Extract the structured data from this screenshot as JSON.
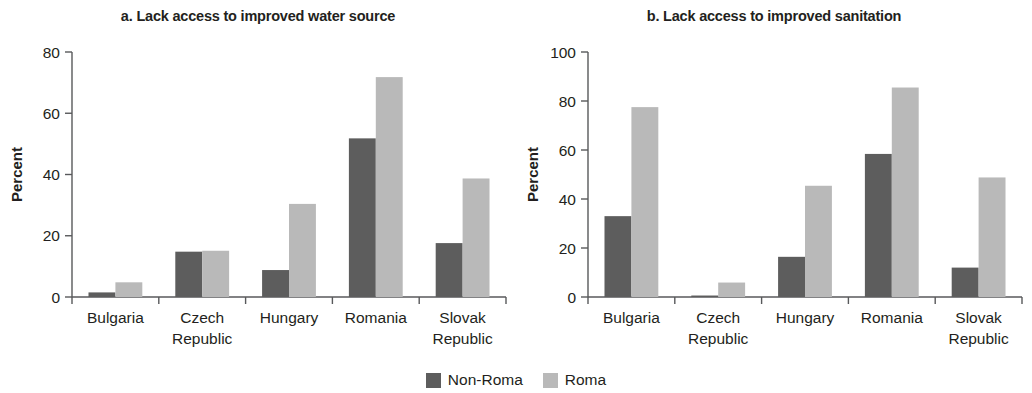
{
  "figure": {
    "legend": [
      {
        "name": "Non-Roma",
        "color": "#5d5d5d"
      },
      {
        "name": "Roma",
        "color": "#b9b9b9"
      }
    ]
  },
  "chart_data": [
    {
      "type": "bar",
      "panel_id": "a",
      "title": "a. Lack access to improved water source",
      "xlabel": "",
      "ylabel": "Percent",
      "ylim": [
        0,
        80
      ],
      "yticks": [
        0,
        20,
        40,
        60,
        80
      ],
      "grid": false,
      "legend_position": "bottom-center",
      "categories": [
        "Bulgaria",
        "Czech Republic",
        "Hungary",
        "Romania",
        "Slovak Republic"
      ],
      "series": [
        {
          "name": "Non-Roma",
          "color": "#5d5d5d",
          "values": [
            1.5,
            14.8,
            8.8,
            51.8,
            17.6
          ]
        },
        {
          "name": "Roma",
          "color": "#b9b9b9",
          "values": [
            4.8,
            15.1,
            30.4,
            71.8,
            38.7
          ]
        }
      ]
    },
    {
      "type": "bar",
      "panel_id": "b",
      "title": "b. Lack access to improved sanitation",
      "xlabel": "",
      "ylabel": "Percent",
      "ylim": [
        0,
        100
      ],
      "yticks": [
        0,
        20,
        40,
        60,
        80,
        100
      ],
      "grid": false,
      "legend_position": "bottom-center",
      "categories": [
        "Bulgaria",
        "Czech Republic",
        "Hungary",
        "Romania",
        "Slovak Republic"
      ],
      "series": [
        {
          "name": "Non-Roma",
          "color": "#5d5d5d",
          "values": [
            33.0,
            0.6,
            16.4,
            58.4,
            12.0
          ]
        },
        {
          "name": "Roma",
          "color": "#b9b9b9",
          "values": [
            77.5,
            5.9,
            45.4,
            85.5,
            48.8
          ]
        }
      ]
    }
  ]
}
